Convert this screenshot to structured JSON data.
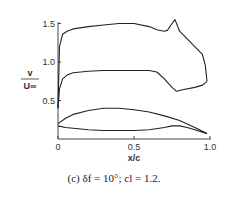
{
  "chart_data": {
    "type": "line",
    "title": "",
    "caption": "(c) δf = 10°; cl = 1.2.",
    "xlabel": "x/c",
    "ylabel_num": "v",
    "ylabel_den": "U∞",
    "xlim": [
      0,
      1.0
    ],
    "ylim": [
      0,
      1.5
    ],
    "xticks": [
      "0",
      "0.5",
      "1.0"
    ],
    "yticks": [
      "0.5",
      "1.0",
      "1.5"
    ],
    "grid": false,
    "legend": null,
    "series": [
      {
        "name": "upper surface velocity",
        "x": [
          0.0,
          0.01,
          0.03,
          0.06,
          0.1,
          0.2,
          0.3,
          0.4,
          0.5,
          0.6,
          0.65,
          0.7,
          0.72,
          0.75,
          0.77,
          0.8,
          0.85,
          0.9,
          0.95,
          0.97,
          0.98
        ],
        "y": [
          0.4,
          1.2,
          1.36,
          1.4,
          1.43,
          1.46,
          1.48,
          1.5,
          1.5,
          1.46,
          1.42,
          1.4,
          1.41,
          1.5,
          1.55,
          1.4,
          1.3,
          1.2,
          1.1,
          0.95,
          0.75
        ]
      },
      {
        "name": "lower surface velocity",
        "x": [
          0.0,
          0.01,
          0.03,
          0.06,
          0.1,
          0.2,
          0.3,
          0.4,
          0.5,
          0.6,
          0.65,
          0.7,
          0.75,
          0.78,
          0.82,
          0.9,
          0.95,
          0.98
        ],
        "y": [
          0.4,
          0.65,
          0.78,
          0.83,
          0.86,
          0.88,
          0.89,
          0.89,
          0.89,
          0.89,
          0.87,
          0.78,
          0.67,
          0.62,
          0.64,
          0.67,
          0.7,
          0.75
        ]
      },
      {
        "name": "airfoil upper contour",
        "x": [
          0.0,
          0.05,
          0.1,
          0.2,
          0.3,
          0.4,
          0.5,
          0.6,
          0.7,
          0.8,
          0.9,
          0.98
        ],
        "y": [
          0.2,
          0.27,
          0.32,
          0.37,
          0.4,
          0.4,
          0.38,
          0.35,
          0.3,
          0.24,
          0.15,
          0.07
        ]
      },
      {
        "name": "airfoil lower contour",
        "x": [
          0.0,
          0.05,
          0.1,
          0.2,
          0.3,
          0.4,
          0.5,
          0.6,
          0.7,
          0.75,
          0.8,
          0.85,
          0.9,
          0.98
        ],
        "y": [
          0.17,
          0.15,
          0.14,
          0.12,
          0.11,
          0.11,
          0.11,
          0.12,
          0.15,
          0.17,
          0.17,
          0.15,
          0.12,
          0.07
        ]
      }
    ]
  }
}
